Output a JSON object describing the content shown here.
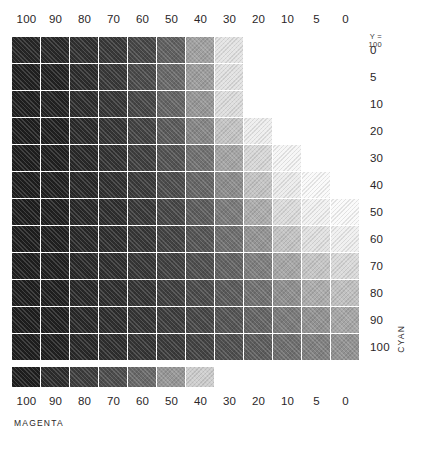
{
  "chart_data": {
    "type": "heatmap",
    "title": "",
    "xlabel": "MAGENTA",
    "ylabel": "CYAN",
    "annotation": {
      "line1": "Y =",
      "line2": "100"
    },
    "x_categories": [
      "100",
      "90",
      "80",
      "70",
      "60",
      "50",
      "40",
      "30",
      "20",
      "10",
      "5",
      "0"
    ],
    "y_categories": [
      "0",
      "5",
      "10",
      "20",
      "30",
      "40",
      "50",
      "60",
      "70",
      "80",
      "90",
      "100"
    ],
    "x_top_categories": [
      "100",
      "90",
      "80",
      "70",
      "60",
      "50",
      "40",
      "30",
      "20",
      "10",
      "5",
      "0"
    ],
    "x_bottom_categories": [
      "100",
      "90",
      "80",
      "70",
      "60",
      "50",
      "40",
      "30",
      "20",
      "10",
      "5",
      "0"
    ],
    "legend_position": "none",
    "grid": false,
    "note": "CMY process-color patch chart rendered in grayscale; each cell is the printed tone for a cyan (row) x magenta (column) combination at Y=100. Blank cells are unprinted paper white. Values below are the rendered gray levels (0-255) of each patch.",
    "rows": [
      {
        "cyan": "0",
        "values": [
          38,
          40,
          48,
          56,
          70,
          96,
          160,
          228,
          null,
          null,
          null,
          null
        ]
      },
      {
        "cyan": "5",
        "values": [
          32,
          34,
          44,
          56,
          74,
          104,
          156,
          226,
          null,
          null,
          null,
          null
        ]
      },
      {
        "cyan": "10",
        "values": [
          32,
          34,
          44,
          54,
          70,
          100,
          150,
          222,
          null,
          null,
          null,
          null
        ]
      },
      {
        "cyan": "20",
        "values": [
          30,
          32,
          42,
          52,
          66,
          90,
          134,
          196,
          238,
          null,
          null,
          null
        ]
      },
      {
        "cyan": "30",
        "values": [
          30,
          32,
          40,
          50,
          62,
          82,
          112,
          164,
          216,
          246,
          null,
          null
        ]
      },
      {
        "cyan": "40",
        "values": [
          30,
          32,
          40,
          48,
          58,
          76,
          102,
          140,
          196,
          236,
          250,
          null
        ]
      },
      {
        "cyan": "50",
        "values": [
          30,
          32,
          40,
          46,
          56,
          70,
          92,
          122,
          172,
          220,
          242,
          250
        ]
      },
      {
        "cyan": "60",
        "values": [
          30,
          32,
          40,
          46,
          54,
          66,
          84,
          110,
          148,
          196,
          226,
          240
        ]
      },
      {
        "cyan": "70",
        "values": [
          30,
          32,
          40,
          46,
          54,
          64,
          78,
          98,
          126,
          166,
          198,
          218
        ]
      },
      {
        "cyan": "80",
        "values": [
          30,
          32,
          40,
          46,
          52,
          62,
          74,
          90,
          112,
          142,
          172,
          192
        ]
      },
      {
        "cyan": "90",
        "values": [
          30,
          32,
          40,
          46,
          52,
          60,
          70,
          84,
          100,
          122,
          146,
          166
        ]
      },
      {
        "cyan": "100",
        "values": [
          30,
          32,
          40,
          46,
          52,
          58,
          66,
          78,
          92,
          110,
          128,
          146
        ]
      }
    ],
    "bottom_strip": {
      "label": "magenta-only scale (no cyan)",
      "values": [
        30,
        44,
        60,
        76,
        104,
        150,
        206,
        null,
        null,
        null,
        null,
        null
      ]
    }
  }
}
